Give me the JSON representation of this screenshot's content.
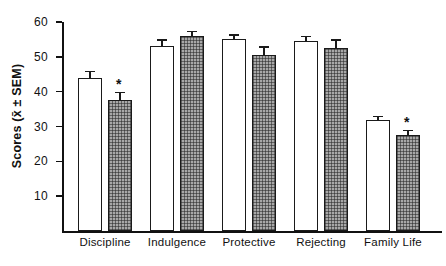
{
  "chart_data": {
    "type": "bar",
    "title": "",
    "xlabel": "",
    "ylabel": "Scores (x̄ ± SEM)",
    "categories": [
      "Discipline",
      "Indulgence",
      "Protective",
      "Rejecting",
      "Family Life"
    ],
    "ylim": [
      0,
      60
    ],
    "ytick_labels": [
      "60",
      "50",
      "40",
      "30",
      "20",
      "10"
    ],
    "yticks": [
      60,
      50,
      40,
      30,
      20,
      10
    ],
    "grid": false,
    "legend": "none",
    "annotation_note": "* denotes significant difference",
    "series": [
      {
        "name": "Open bars",
        "fill": "white",
        "values": [
          44.0,
          53.0,
          55.0,
          54.5,
          32.0
        ],
        "errors": [
          2.0,
          2.0,
          1.5,
          1.5,
          1.0
        ],
        "stars": [
          false,
          false,
          false,
          false,
          false
        ]
      },
      {
        "name": "Hatched bars",
        "fill": "hatched-gray",
        "values": [
          37.5,
          56.0,
          50.5,
          52.5,
          27.5
        ],
        "errors": [
          2.5,
          1.5,
          2.5,
          2.5,
          1.5
        ],
        "stars": [
          true,
          false,
          false,
          false,
          true
        ]
      }
    ],
    "star_glyph": "*"
  }
}
